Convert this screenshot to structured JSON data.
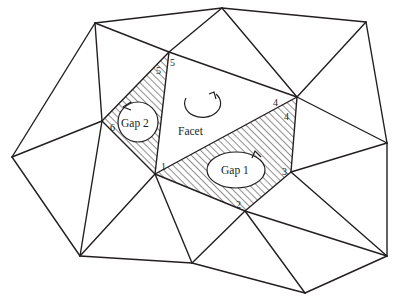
{
  "diagram": {
    "title_labels": {
      "facet": "Facet",
      "gap1": "Gap 1",
      "gap2": "Gap 2"
    },
    "vertex_labels": {
      "v1_outer": "1",
      "v1_inner": "1",
      "v1_gap2": "1",
      "v2": "2",
      "v3": "3",
      "v4_outer": "4",
      "v4_inner": "4",
      "v5_outer": "5",
      "v5_inner": "5",
      "v6": "6"
    },
    "colors": {
      "line": "#231f20",
      "background": "#ffffff"
    },
    "icons": {
      "facet_orientation": "counterclockwise-arrow-icon",
      "gap1_orientation": "counterclockwise-arrow-icon",
      "gap2_orientation": "counterclockwise-arrow-icon"
    }
  }
}
